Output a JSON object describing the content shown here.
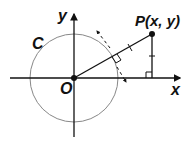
{
  "labels": {
    "y_axis": "y",
    "x_axis": "x",
    "origin": "O",
    "circle": "C",
    "point": "P(x, y)"
  },
  "colors": {
    "axis": "#111111",
    "circle": "#888888",
    "line": "#111111"
  }
}
